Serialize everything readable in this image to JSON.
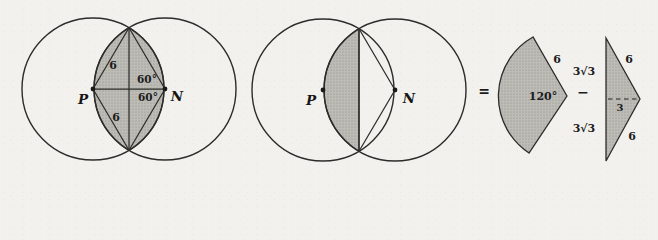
{
  "palette": {
    "paper_background": "#f2f1ee",
    "line_ink": "#2c2c2a",
    "shade_base": "#bdbcb6",
    "shade_dot": "#8e8d85",
    "text_ink": "#1c1c1c"
  },
  "fig_left": {
    "point_p": "P",
    "point_n": "N",
    "radius_label_top": "6",
    "radius_label_bottom": "6",
    "angle_label_top": "60°",
    "angle_label_bottom": "60°"
  },
  "fig_middle": {
    "point_p": "P",
    "point_n": "N"
  },
  "equation": {
    "equals_sign": "=",
    "minus_sign": "−",
    "sector": {
      "angle_label": "120°",
      "radius_label": "6"
    },
    "triangle": {
      "left_half_top_label": "3√3",
      "left_half_bottom_label": "3√3",
      "hypotenuse_top_label": "6",
      "hypotenuse_bottom_label": "6",
      "height_label": "3"
    }
  }
}
